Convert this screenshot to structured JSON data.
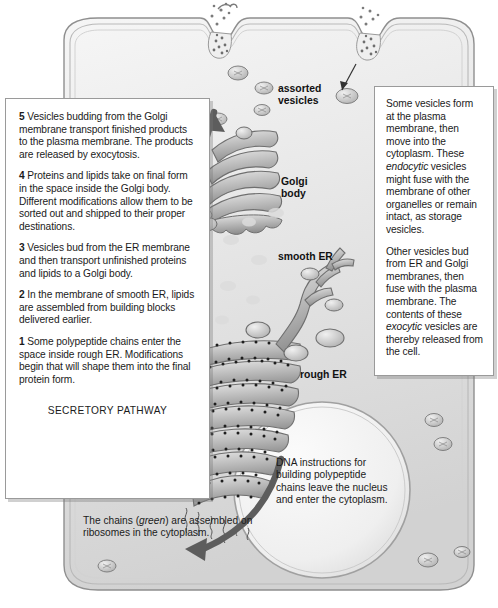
{
  "diagram": {
    "colors": {
      "cytoplasm_light": "#f2f2f2",
      "cytoplasm_mid": "#dcdcdc",
      "membrane": "#9b9b9b",
      "organelle_fill": "#b9b9b9",
      "organelle_dark": "#8e8e8e",
      "arrow": "#5a5a5a",
      "nucleus_fill": "#f4f4f4",
      "text": "#1b1b1b",
      "box_border": "#9a9a9a"
    }
  },
  "left_box": {
    "steps": [
      {
        "number": "5",
        "text": "Vesicles budding from the Golgi membrane transport finished products to the plasma membrane. The products are released by exocytosis."
      },
      {
        "number": "4",
        "text": "Proteins and lipids take on final form in the space inside the Golgi body. Different modifications allow them to be sorted out and shipped to their proper destinations."
      },
      {
        "number": "3",
        "text": "Vesicles bud from the ER membrane and then transport unfinished proteins and lipids to a Golgi body."
      },
      {
        "number": "2",
        "text": "In the membrane of smooth ER, lipids are assembled from building blocks delivered earlier."
      },
      {
        "number": "1",
        "text": "Some polypeptide chains enter the space inside rough ER. Modifications begin that will shape them into the final protein form."
      }
    ],
    "pathway_label": "SECRETORY PATHWAY"
  },
  "right_box": {
    "paragraph_1": {
      "before": "Some vesicles form at the plasma membrane, then move into the cytoplasm. These ",
      "italic": "endocytic",
      "after": " vesicles might fuse with the membrane of other organelles or remain intact, as storage vesicles."
    },
    "paragraph_2": {
      "before": "Other vesicles bud from ER and Golgi membranes, then fuse with the plasma membrane. The contents of these ",
      "italic": "exocytic",
      "after": " vesicles are thereby released from the cell."
    }
  },
  "diagram_labels": {
    "assorted_vesicles": "assorted\nvesicles",
    "assorted_vesicles_line1": "assorted",
    "assorted_vesicles_line2": "vesicles",
    "golgi_line1": "Golgi",
    "golgi_line2": "body",
    "smooth_er": "smooth ER",
    "rough_er": "rough ER"
  },
  "nucleus_caption": {
    "text": "DNA instructions for building polypeptide chains leave the nucleus and enter the cytoplasm."
  },
  "bottom_caption": {
    "before": "The chains (",
    "italic": "green",
    "after": ") are assembled on ribosomes in the cytoplasm."
  }
}
